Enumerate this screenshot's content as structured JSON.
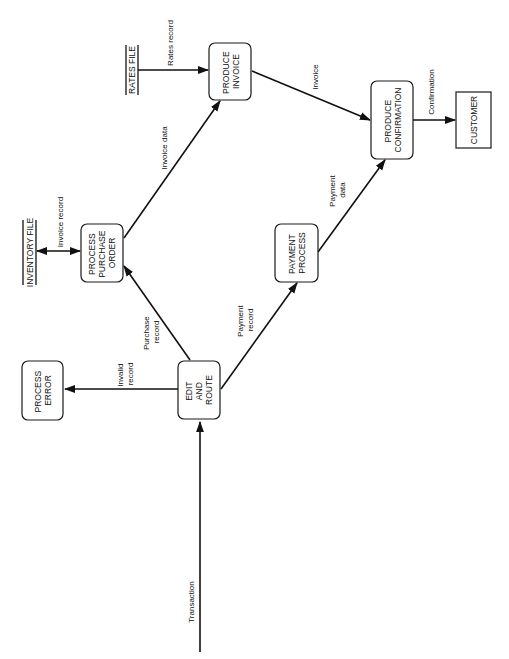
{
  "diagram": {
    "type": "data-flow-diagram",
    "orientation": "rotated-90-ccw",
    "colors": {
      "ink": "#111111",
      "background": "#ffffff"
    },
    "processes": {
      "process_error": {
        "lines": [
          "PROCESS",
          "ERROR"
        ]
      },
      "edit_and_route": {
        "lines": [
          "EDIT",
          "AND",
          "ROUTE"
        ]
      },
      "process_purchase_order": {
        "lines": [
          "PROCESS",
          "PURCHASE",
          "ORDER"
        ]
      },
      "payment_process": {
        "lines": [
          "PAYMENT",
          "PROCESS"
        ]
      },
      "produce_invoice": {
        "lines": [
          "PRODUCE",
          "INVOICE"
        ]
      },
      "produce_confirmation": {
        "lines": [
          "PRODUCE",
          "CONFIRMATION"
        ]
      }
    },
    "external_entities": {
      "customer": {
        "label": "CUSTOMER"
      }
    },
    "data_stores": {
      "inventory_file": {
        "label": "INVENTORY FILE"
      },
      "rates_file": {
        "label": "RATES FILE"
      }
    },
    "flows": {
      "transaction": {
        "lines": [
          "Transaction"
        ],
        "from": "",
        "to": "EDIT AND ROUTE"
      },
      "invalid_record": {
        "lines": [
          "Invalid",
          "record"
        ],
        "from": "EDIT AND ROUTE",
        "to": "PROCESS ERROR"
      },
      "purchase_record": {
        "lines": [
          "Purchase",
          "record"
        ],
        "from": "EDIT AND ROUTE",
        "to": "PROCESS PURCHASE ORDER"
      },
      "payment_record": {
        "lines": [
          "Payment",
          "record"
        ],
        "from": "EDIT AND ROUTE",
        "to": "PAYMENT PROCESS"
      },
      "invoice_record": {
        "lines": [
          "Invoice record"
        ],
        "from": "INVENTORY FILE",
        "to": "PROCESS PURCHASE ORDER",
        "bidirectional": true
      },
      "invoice_data": {
        "lines": [
          "Invoice data"
        ],
        "from": "PROCESS PURCHASE ORDER",
        "to": "PRODUCE INVOICE"
      },
      "rates_record": {
        "lines": [
          "Rates record"
        ],
        "from": "RATES FILE",
        "to": "PRODUCE INVOICE"
      },
      "payment_data": {
        "lines": [
          "Payment",
          "data"
        ],
        "from": "PAYMENT PROCESS",
        "to": "PRODUCE CONFIRMATION"
      },
      "invoice": {
        "lines": [
          "Invoice"
        ],
        "from": "PRODUCE INVOICE",
        "to": "PRODUCE CONFIRMATION"
      },
      "confirmation": {
        "lines": [
          "Confirmation"
        ],
        "from": "PRODUCE CONFIRMATION",
        "to": "CUSTOMER"
      }
    }
  }
}
